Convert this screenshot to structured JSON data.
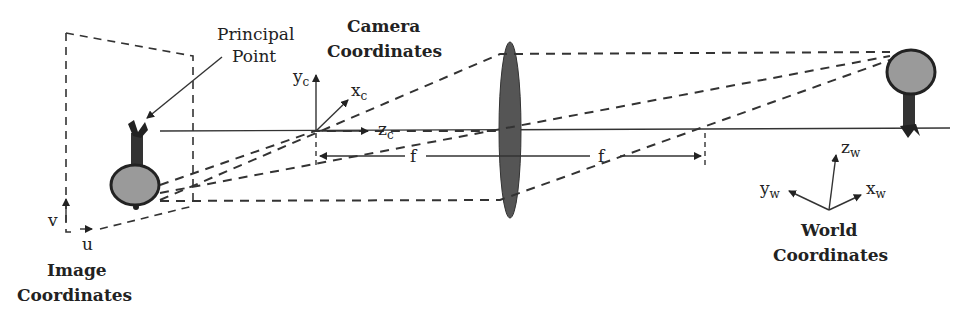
{
  "diagram": {
    "labels": {
      "principal_point_line1": "Principal",
      "principal_point_line2": "Point",
      "camera_coords_line1": "Camera",
      "camera_coords_line2": "Coordinates",
      "image_coords_line1": "Image",
      "image_coords_line2": "Coordinates",
      "world_coords_line1": "World",
      "world_coords_line2": "Coordinates",
      "focal_left": "f",
      "focal_right": "f"
    },
    "axes": {
      "image": {
        "u": "u",
        "v": "v"
      },
      "camera": {
        "x": "x",
        "x_sub": "c",
        "y": "y",
        "y_sub": "c",
        "z": "z",
        "z_sub": "c"
      },
      "world": {
        "x": "x",
        "x_sub": "w",
        "y": "y",
        "y_sub": "w",
        "z": "z",
        "z_sub": "w"
      }
    },
    "colors": {
      "line": "#333333",
      "lens": "#555555",
      "tree_canopy": "#9a9a9a",
      "tree_trunk": "#333333"
    }
  }
}
